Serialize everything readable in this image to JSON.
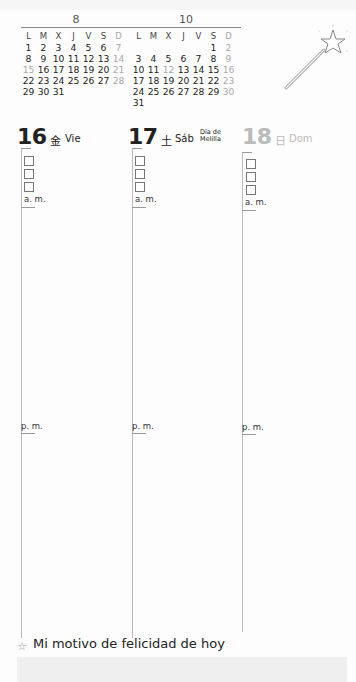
{
  "mini_calendars": [
    {
      "month": "8",
      "weekdays": [
        "L",
        "M",
        "X",
        "J",
        "V",
        "S",
        "D"
      ],
      "weeks": [
        [
          "1",
          "2",
          "3",
          "4",
          "5",
          "6",
          "7"
        ],
        [
          "8",
          "9",
          "10",
          "11",
          "12",
          "13",
          "14"
        ],
        [
          "15",
          "16",
          "17",
          "18",
          "19",
          "20",
          "21"
        ],
        [
          "22",
          "23",
          "24",
          "25",
          "26",
          "27",
          "28"
        ],
        [
          "29",
          "30",
          "31",
          "",
          "",
          "",
          ""
        ]
      ],
      "grey_days": [
        "7",
        "14",
        "15",
        "21",
        "28"
      ]
    },
    {
      "month": "10",
      "weekdays": [
        "L",
        "M",
        "X",
        "J",
        "V",
        "S",
        "D"
      ],
      "weeks": [
        [
          "",
          "",
          "",
          "",
          "",
          "1",
          "2"
        ],
        [
          "3",
          "4",
          "5",
          "6",
          "7",
          "8",
          "9"
        ],
        [
          "10",
          "11",
          "12",
          "13",
          "14",
          "15",
          "16"
        ],
        [
          "17",
          "18",
          "19",
          "20",
          "21",
          "22",
          "23"
        ],
        [
          "24",
          "25",
          "26",
          "27",
          "28",
          "29",
          "30"
        ],
        [
          "31",
          "",
          "",
          "",
          "",
          "",
          ""
        ]
      ],
      "grey_days": [
        "2",
        "9",
        "12",
        "16",
        "23",
        "30"
      ]
    }
  ],
  "decoration": {
    "icon": "magic-wand-star"
  },
  "days": [
    {
      "number": "16",
      "kanji": "金",
      "name": "Vie",
      "holiday": ""
    },
    {
      "number": "17",
      "kanji": "土",
      "name": "Sáb",
      "holiday_line1": "Día de",
      "holiday_line2": "Melilla"
    },
    {
      "number": "18",
      "kanji": "日",
      "name": "Dom",
      "holiday": ""
    }
  ],
  "labels": {
    "am": "a. m.",
    "pm": "p. m."
  },
  "footer": {
    "star": "☆",
    "text": "Mi motivo de felicidad de hoy"
  },
  "colors": {
    "text": "#222222",
    "grey": "#aaaaaa",
    "line": "#bbbbbb",
    "band": "#efefef"
  }
}
